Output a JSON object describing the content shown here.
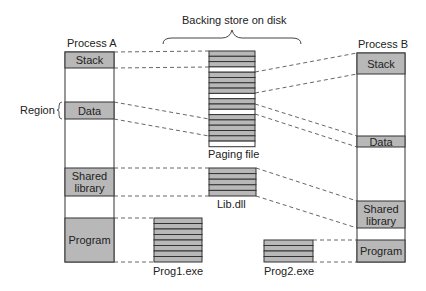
{
  "title": "Backing store on disk",
  "region_label": "Region",
  "colors": {
    "fill": "#b8b8b8",
    "stroke": "#333333",
    "dash": "#555555",
    "background": "#ffffff"
  },
  "process_a": {
    "label": "Process A",
    "segments": [
      {
        "name": "stack",
        "label": "Stack"
      },
      {
        "name": "data",
        "label": "Data"
      },
      {
        "name": "shared-library",
        "label": "Shared\nlibrary"
      },
      {
        "name": "program",
        "label": "Program"
      }
    ]
  },
  "process_b": {
    "label": "Process B",
    "segments": [
      {
        "name": "stack",
        "label": "Stack"
      },
      {
        "name": "data",
        "label": "Data"
      },
      {
        "name": "shared-library",
        "label": "Shared\nlibrary"
      },
      {
        "name": "program",
        "label": "Program"
      }
    ]
  },
  "files": {
    "paging_file": "Paging file",
    "lib_dll": "Lib.dll",
    "prog1": "Prog1.exe",
    "prog2": "Prog2.exe"
  }
}
